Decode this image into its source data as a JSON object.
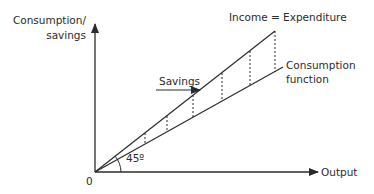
{
  "diagram": {
    "y_axis_label_line1": "Consumption/",
    "y_axis_label_line2": "savings",
    "x_axis_label": "Output",
    "origin_label": "0",
    "angle_label": "45º",
    "income_line_label": "Income = Expenditure",
    "consumption_label_line1": "Consumption",
    "consumption_label_line2": "function",
    "savings_label": "Savings",
    "colors": {
      "line": "#2b2b2b",
      "background": "#ffffff"
    }
  }
}
